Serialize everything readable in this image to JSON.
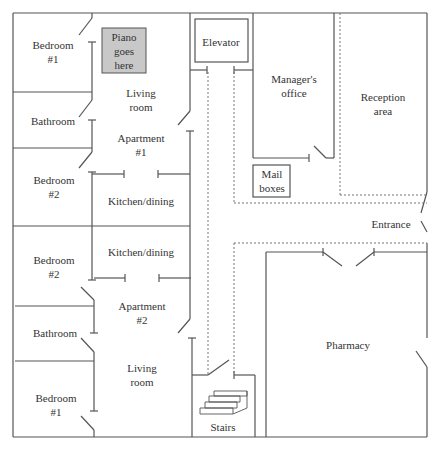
{
  "plan": {
    "rooms": {
      "apt1_bedroom1": {
        "label": "Bedroom",
        "num": "#1"
      },
      "apt1_piano": {
        "l1": "Piano",
        "l2": "goes",
        "l3": "here"
      },
      "apt1_living": {
        "l1": "Living",
        "l2": "room"
      },
      "apt1_bathroom": {
        "label": "Bathroom"
      },
      "apt1_title": {
        "l1": "Apartment",
        "l2": "#1"
      },
      "apt1_bedroom2": {
        "label": "Bedroom",
        "num": "#2"
      },
      "apt1_kitchen": {
        "label": "Kitchen/dining"
      },
      "apt2_kitchen": {
        "label": "Kitchen/dining"
      },
      "apt2_bedroom2": {
        "label": "Bedroom",
        "num": "#2"
      },
      "apt2_title": {
        "l1": "Apartment",
        "l2": "#2"
      },
      "apt2_bathroom": {
        "label": "Bathroom"
      },
      "apt2_living": {
        "l1": "Living",
        "l2": "room"
      },
      "apt2_bedroom1": {
        "label": "Bedroom",
        "num": "#1"
      },
      "elevator": {
        "label": "Elevator"
      },
      "managers_office": {
        "l1": "Manager's",
        "l2": "office"
      },
      "reception": {
        "l1": "Reception",
        "l2": "area"
      },
      "mail_boxes": {
        "l1": "Mail",
        "l2": "boxes"
      },
      "entrance": {
        "label": "Entrance"
      },
      "pharmacy": {
        "label": "Pharmacy"
      },
      "stairs": {
        "label": "Stairs"
      }
    },
    "colors": {
      "wall": "#555555",
      "piano_fill": "#c8c8c8",
      "dotted": "#777777"
    }
  }
}
